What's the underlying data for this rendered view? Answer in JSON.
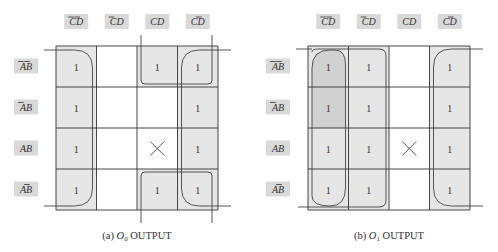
{
  "col_labels": [
    {
      "text": "CD",
      "bar": [
        1,
        1
      ]
    },
    {
      "text": "CD",
      "bar": [
        1,
        0
      ]
    },
    {
      "text": "CD",
      "bar": [
        0,
        0
      ]
    },
    {
      "text": "CD",
      "bar": [
        0,
        1
      ]
    }
  ],
  "row_labels": [
    {
      "text": "AB",
      "bar": [
        1,
        1
      ]
    },
    {
      "text": "AB",
      "bar": [
        1,
        0
      ]
    },
    {
      "text": "AB",
      "bar": [
        0,
        0
      ]
    },
    {
      "text": "AB",
      "bar": [
        0,
        1
      ]
    }
  ],
  "colors": {
    "cell_fill": "#e6e6e6",
    "group_fill": "#e2e2e2",
    "overlap_fill": "#c9c9c9",
    "label_bg": "#d9d9d9",
    "line": "#333333"
  },
  "maps": [
    {
      "id": "o0",
      "caption_prefix": "(a)",
      "caption_var": "O",
      "caption_sub": "0",
      "caption_suffix": "OUTPUT",
      "cells": [
        [
          "1",
          "",
          "1",
          "1"
        ],
        [
          "1",
          "",
          "",
          "1"
        ],
        [
          "1",
          "",
          "X",
          "1"
        ],
        [
          "1",
          "",
          "1",
          "1"
        ]
      ]
    },
    {
      "id": "o1",
      "caption_prefix": "(b)",
      "caption_var": "O",
      "caption_sub": "1",
      "caption_suffix": "OUTPUT",
      "cells": [
        [
          "1",
          "1",
          "",
          "1"
        ],
        [
          "1",
          "1",
          "",
          "1"
        ],
        [
          "1",
          "1",
          "X",
          "1"
        ],
        [
          "1",
          "1",
          "",
          "1"
        ]
      ]
    }
  ]
}
